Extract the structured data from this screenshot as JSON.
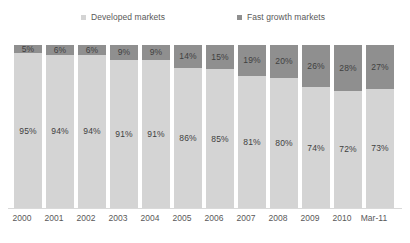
{
  "legend": {
    "position": "top",
    "entries": [
      {
        "label": "Developed markets",
        "color": "#d4d4d4",
        "key": "developed"
      },
      {
        "label": "Fast growth markets",
        "color": "#8f8f8f",
        "key": "fast_growth"
      }
    ]
  },
  "axis": {
    "x_tick_labels": [
      "2000",
      "2001",
      "2002",
      "2003",
      "2004",
      "2005",
      "2006",
      "2007",
      "2008",
      "2009",
      "2010",
      "Mar-11"
    ]
  },
  "labels": {
    "developed": [
      "95%",
      "94%",
      "94%",
      "91%",
      "91%",
      "86%",
      "85%",
      "81%",
      "80%",
      "74%",
      "72%",
      "73%"
    ],
    "fast_growth": [
      "5%",
      "6%",
      "6%",
      "9%",
      "9%",
      "14%",
      "15%",
      "19%",
      "20%",
      "26%",
      "28%",
      "27%"
    ]
  },
  "chart_data": {
    "type": "bar",
    "stacked": true,
    "stack_total": 100,
    "title": "",
    "subtitle": "",
    "xlabel": "",
    "ylabel": "",
    "ylim": [
      0,
      100
    ],
    "grid": false,
    "legend_position": "top",
    "categories": [
      "2000",
      "2001",
      "2002",
      "2003",
      "2004",
      "2005",
      "2006",
      "2007",
      "2008",
      "2009",
      "2010",
      "Mar-11"
    ],
    "series": [
      {
        "name": "Developed markets",
        "color": "#d4d4d4",
        "values": [
          95,
          94,
          94,
          91,
          91,
          86,
          85,
          81,
          80,
          74,
          72,
          73
        ],
        "data_labels": [
          "95%",
          "94%",
          "94%",
          "91%",
          "91%",
          "86%",
          "85%",
          "81%",
          "80%",
          "74%",
          "72%",
          "73%"
        ]
      },
      {
        "name": "Fast growth markets",
        "color": "#8f8f8f",
        "values": [
          5,
          6,
          6,
          9,
          9,
          14,
          15,
          19,
          20,
          26,
          28,
          27
        ],
        "data_labels": [
          "5%",
          "6%",
          "6%",
          "9%",
          "9%",
          "14%",
          "15%",
          "19%",
          "20%",
          "26%",
          "28%",
          "27%"
        ]
      }
    ]
  }
}
